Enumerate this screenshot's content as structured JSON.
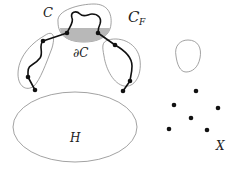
{
  "diagram": {
    "labels": {
      "C": "C",
      "C_F": "C",
      "C_F_sub": "F",
      "boundary_C": "∂C",
      "H": "H",
      "X": "X"
    },
    "colors": {
      "shaded_region": "#b8b8b8",
      "outline": "#8a8a8a",
      "path": "#111111",
      "dot": "#111111"
    },
    "regions": [
      {
        "name": "C",
        "description": "top region containing shaded boundary ∂C"
      },
      {
        "name": "C_F",
        "description": "union of component loops around paths"
      },
      {
        "name": "H",
        "description": "large ellipse at bottom"
      },
      {
        "name": "isolated-loop",
        "description": "small closed curve at right"
      },
      {
        "name": "X",
        "description": "scattered point set of 6 dots"
      }
    ],
    "x_points": [
      {
        "x": 196,
        "y": 91
      },
      {
        "x": 174,
        "y": 105
      },
      {
        "x": 218,
        "y": 108
      },
      {
        "x": 191,
        "y": 118
      },
      {
        "x": 169,
        "y": 129
      },
      {
        "x": 207,
        "y": 130
      }
    ]
  }
}
